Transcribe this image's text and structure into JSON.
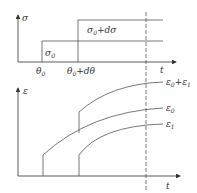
{
  "upper_plot": {
    "y_label": "σ",
    "x_label": "t",
    "step1_label": "σ",
    "step1_sub": "0",
    "step2_label_a": "σ",
    "step2_label_sub": "0",
    "step2_label_b": "+dσ",
    "tick1_label": "θ",
    "tick1_sub": "0",
    "tick2_label_a": "θ",
    "tick2_sub": "0",
    "tick2_label_b": "+dθ"
  },
  "lower_plot": {
    "y_label": "ε",
    "x_label": "t",
    "curves": [
      {
        "label": "ε",
        "sub": "0",
        "suffix": "+ε",
        "suffix_sub": "1"
      },
      {
        "label": "ε",
        "sub": "0"
      },
      {
        "label": "ε",
        "sub": "1"
      }
    ]
  },
  "colors": {
    "line": "#555555",
    "axis": "#333333"
  }
}
